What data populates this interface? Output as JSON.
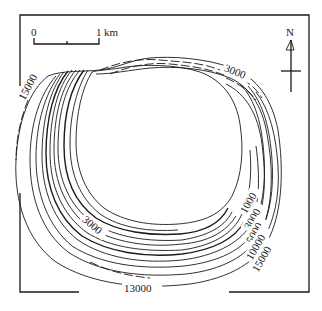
{
  "map": {
    "type": "contour-map",
    "scale_bar": {
      "start_label": "0",
      "end_label": "1",
      "unit": "km"
    },
    "north_arrow": {
      "label": "N"
    },
    "contour_labels": [
      {
        "id": "top",
        "text": "3000"
      },
      {
        "id": "left",
        "text": "15000"
      },
      {
        "id": "inner-left",
        "text": "3000"
      },
      {
        "id": "right-1000",
        "text": "1000"
      },
      {
        "id": "right-3000",
        "text": "3000"
      },
      {
        "id": "right-5000",
        "text": "5000"
      },
      {
        "id": "right-10000",
        "text": "10000"
      },
      {
        "id": "right-15000",
        "text": "15000"
      },
      {
        "id": "bottom",
        "text": "13000"
      }
    ],
    "colors": {
      "line": "#1a1a1a",
      "background": "#ffffff"
    }
  }
}
